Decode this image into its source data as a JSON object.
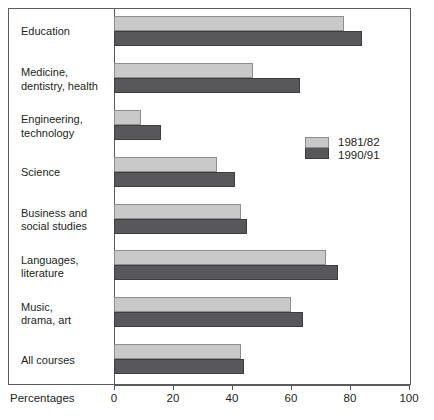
{
  "chart_data": {
    "type": "bar",
    "orientation": "horizontal",
    "title": "",
    "xlabel": "Percentages",
    "ylabel": "",
    "xlim": [
      0,
      100
    ],
    "xticks": [
      0,
      20,
      40,
      60,
      80,
      100
    ],
    "xtick_labels": [
      "0",
      "20",
      "40",
      "60",
      "80",
      "100"
    ],
    "grid": false,
    "legend_position": "right-middle",
    "categories": [
      "Education",
      "Medicine,\ndentistry, health",
      "Engineering,\ntechnology",
      "Science",
      "Business and\nsocial studies",
      "Languages,\nliterature",
      "Music,\ndrama, art",
      "All courses"
    ],
    "series": [
      {
        "name": "1981/82",
        "color": "#c9c9c9",
        "values": [
          78,
          47,
          9,
          35,
          43,
          72,
          60,
          43
        ]
      },
      {
        "name": "1990/91",
        "color": "#58585a",
        "values": [
          84,
          63,
          16,
          41,
          45,
          76,
          64,
          44
        ]
      }
    ]
  },
  "axis": {
    "xlabel": "Percentages"
  },
  "legend": {
    "entries": [
      {
        "label": "1981/82"
      },
      {
        "label": "1990/91"
      }
    ]
  }
}
